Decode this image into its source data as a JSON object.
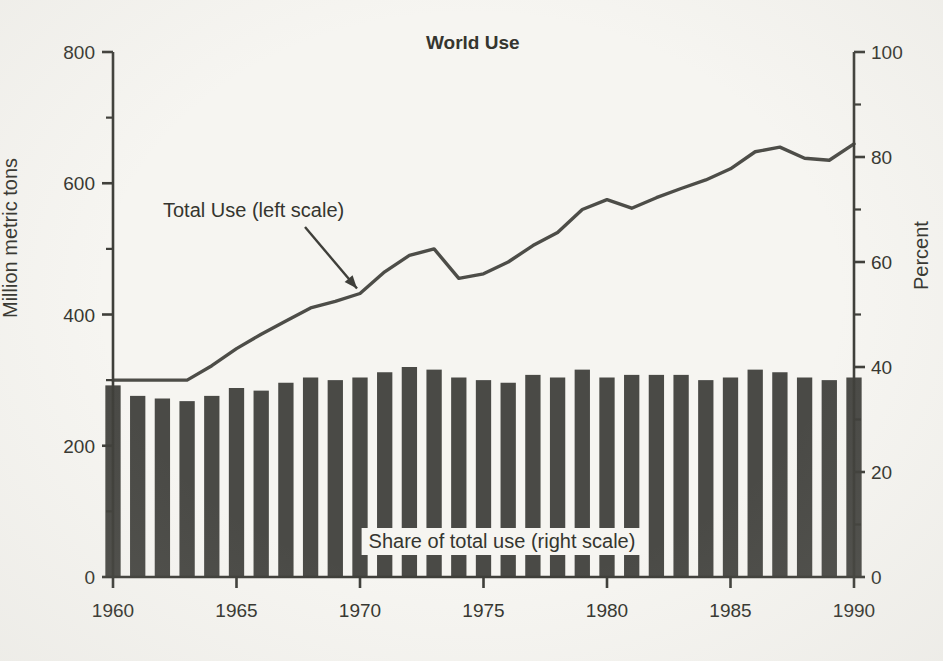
{
  "chart_data": {
    "type": "bar",
    "title": "World Use",
    "xlabel": "",
    "ylabel": "Million metric tons",
    "ylabel_secondary": "Percent",
    "grid": false,
    "legend_position": "inline-annotations",
    "xlim": [
      1960,
      1990
    ],
    "ylim": [
      0,
      800
    ],
    "ylim_secondary": [
      0,
      100
    ],
    "x_ticks": [
      1960,
      1965,
      1970,
      1975,
      1980,
      1985,
      1990
    ],
    "y_ticks_left": [
      0,
      200,
      400,
      600,
      800
    ],
    "y_ticks_left_minor": [
      100,
      300,
      500,
      700
    ],
    "y_ticks_right": [
      0,
      20,
      40,
      60,
      80,
      100
    ],
    "y_ticks_right_minor": [
      10,
      30,
      50,
      70,
      90
    ],
    "x": [
      1960,
      1961,
      1962,
      1963,
      1964,
      1965,
      1966,
      1967,
      1968,
      1969,
      1970,
      1971,
      1972,
      1973,
      1974,
      1975,
      1976,
      1977,
      1978,
      1979,
      1980,
      1981,
      1982,
      1983,
      1984,
      1985,
      1986,
      1987,
      1988,
      1989,
      1990
    ],
    "series": [
      {
        "name": "Share of total use (right scale)",
        "type": "bar",
        "axis": "right",
        "unit": "percent",
        "color": "#4a4a46",
        "values": [
          36.5,
          34.5,
          34.0,
          33.5,
          34.5,
          36.0,
          35.5,
          37.0,
          38.0,
          37.5,
          38.0,
          39.0,
          40.0,
          39.5,
          38.0,
          37.5,
          37.0,
          38.5,
          38.0,
          39.5,
          38.0,
          38.5,
          38.5,
          38.5,
          37.5,
          38.0,
          39.5,
          39.0,
          38.0,
          37.5,
          38.0
        ]
      },
      {
        "name": "Total Use (left scale)",
        "type": "line",
        "axis": "left",
        "unit": "million metric tons",
        "color": "#4d4d48",
        "values": [
          300,
          300,
          300,
          300,
          322,
          348,
          370,
          390,
          410,
          420,
          432,
          465,
          490,
          500,
          455,
          462,
          480,
          505,
          525,
          560,
          575,
          562,
          578,
          592,
          605,
          622,
          648,
          655,
          638,
          635,
          660
        ]
      }
    ],
    "annotations": [
      {
        "text": "Total Use (left scale)",
        "target_x": 1970,
        "target_y": 432,
        "axis": "left"
      },
      {
        "text": "Share of total use (right scale)",
        "axis": "right"
      }
    ]
  },
  "axes": {
    "left": {
      "title": "Million metric tons",
      "tick_labels": [
        "800",
        "600",
        "400",
        "200",
        "0"
      ]
    },
    "right": {
      "title": "Percent",
      "tick_labels": [
        "100",
        "80",
        "60",
        "40",
        "20",
        "0"
      ]
    },
    "bottom": {
      "tick_labels": [
        "1960",
        "1965",
        "1970",
        "1975",
        "1980",
        "1985",
        "1990"
      ]
    }
  },
  "header": {
    "title": "World Use"
  },
  "annotations": {
    "line_series": "Total Use (left scale)",
    "bar_series": "Share of total use (right scale)"
  }
}
